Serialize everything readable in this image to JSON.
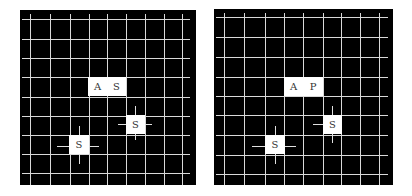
{
  "panels": [
    {
      "id": "left",
      "box": {
        "x": 20,
        "y": 10,
        "w": 176,
        "h": 175
      },
      "background": "#000000",
      "grid_color": "#d9d9d9",
      "vlines": [
        30,
        50,
        70,
        89,
        107,
        126,
        145,
        164,
        182
      ],
      "vline_range": [
        12,
        183
      ],
      "hlines": [
        19,
        39,
        58,
        77,
        97,
        116,
        135,
        154,
        173
      ],
      "hline_range": [
        22,
        190
      ],
      "tiles": [
        {
          "label": "A",
          "x": 88,
          "y": 77,
          "w": 19,
          "h": 19
        },
        {
          "label": "S",
          "x": 107,
          "y": 77,
          "w": 19,
          "h": 19
        },
        {
          "label": "S",
          "x": 126,
          "y": 115,
          "w": 19,
          "h": 19
        },
        {
          "label": "S",
          "x": 69,
          "y": 135,
          "w": 20,
          "h": 19
        }
      ],
      "crosshairs": [
        {
          "cx": 135,
          "cy": 124,
          "left": 118,
          "right": 152,
          "top": 106,
          "bottom": 140
        },
        {
          "cx": 79,
          "cy": 146,
          "left": 57,
          "right": 99,
          "top": 126,
          "bottom": 164
        }
      ]
    },
    {
      "id": "right",
      "box": {
        "x": 214,
        "y": 9,
        "w": 179,
        "h": 176
      },
      "background": "#000000",
      "grid_color": "#d9d9d9",
      "vlines": [
        224,
        244,
        265,
        284,
        303,
        323,
        341,
        360,
        379
      ],
      "vline_range": [
        11,
        183
      ],
      "hlines": [
        17,
        37,
        57,
        77,
        96,
        115,
        135,
        155,
        174
      ],
      "hline_range": [
        216,
        388
      ],
      "tiles": [
        {
          "label": "A",
          "x": 284,
          "y": 77,
          "w": 19,
          "h": 19
        },
        {
          "label": "P",
          "x": 303,
          "y": 77,
          "w": 20,
          "h": 19
        },
        {
          "label": "S",
          "x": 323,
          "y": 115,
          "w": 19,
          "h": 19
        },
        {
          "label": "S",
          "x": 265,
          "y": 135,
          "w": 20,
          "h": 19
        }
      ],
      "crosshairs": [
        {
          "cx": 332,
          "cy": 124,
          "left": 313,
          "right": 332,
          "top": 106,
          "bottom": 143
        },
        {
          "cx": 275,
          "cy": 146,
          "left": 252,
          "right": 296,
          "top": 126,
          "bottom": 164
        }
      ]
    }
  ]
}
